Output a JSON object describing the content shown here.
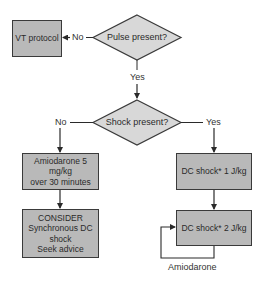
{
  "diagram": {
    "type": "flowchart",
    "colors": {
      "box_fill": "#b9b9b9",
      "diamond_fill": "#d8d8d8",
      "stroke": "#3a3a3a"
    },
    "nodes": {
      "vt_protocol": {
        "label": "VT protocol"
      },
      "pulse_present": {
        "label": "Pulse present?"
      },
      "shock_present": {
        "label": "Shock present?"
      },
      "amiodarone_box": {
        "lines": [
          "Amiodarone 5 mg/kg",
          "over 30 minutes"
        ]
      },
      "consider_box": {
        "lines": [
          "CONSIDER",
          "Synchronous DC",
          "shock",
          "Seek advice"
        ]
      },
      "dc_shock_1": {
        "label": "DC shock* 1 J/kg"
      },
      "dc_shock_2": {
        "label": "DC shock* 2 J/kg"
      }
    },
    "edges": {
      "pulse_no": "No",
      "pulse_yes": "Yes",
      "shock_no": "No",
      "shock_yes": "Yes",
      "loop_label": "Amiodarone"
    }
  }
}
